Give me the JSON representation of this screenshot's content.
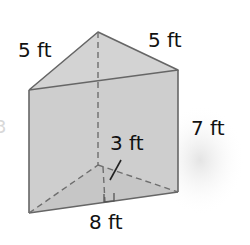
{
  "figure": {
    "type": "triangular-prism",
    "labels": {
      "top_left_edge": "5 ft",
      "top_right_edge": "5 ft",
      "height": "7 ft",
      "triangle_height": "3 ft",
      "base": "8 ft"
    },
    "ghost_text": "3",
    "colors": {
      "front_face": "#c8c8c8",
      "right_face": "#bdbdbd",
      "top_face": "#d2d2d2",
      "bottom_face": "#a9a9a9",
      "edge": "#6a6a6a",
      "hidden_edge": "#7a7a7a",
      "shadow": "#e6e6e6"
    }
  }
}
